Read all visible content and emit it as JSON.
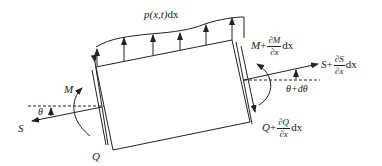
{
  "figure": {
    "type": "free-body diagram of a beam element",
    "colors": {
      "stroke": "#222222",
      "background": "#ffffff"
    }
  },
  "labels": {
    "load": {
      "func": "p(x,t)",
      "dx": "dx"
    },
    "left_moment": "M",
    "left_axial": "S",
    "left_angle": "θ",
    "left_shear": "Q",
    "right_moment": {
      "base": "M",
      "plus": "+",
      "num": "∂M",
      "den": "∂x",
      "dx": "dx"
    },
    "right_axial": {
      "base": "S",
      "plus": "+",
      "num": "∂S",
      "den": "∂x",
      "dx": "dx"
    },
    "right_angle": "θ+dθ",
    "right_shear": {
      "base": "Q",
      "plus": "+",
      "num": "∂Q",
      "den": "∂x",
      "dx": "dx"
    }
  }
}
